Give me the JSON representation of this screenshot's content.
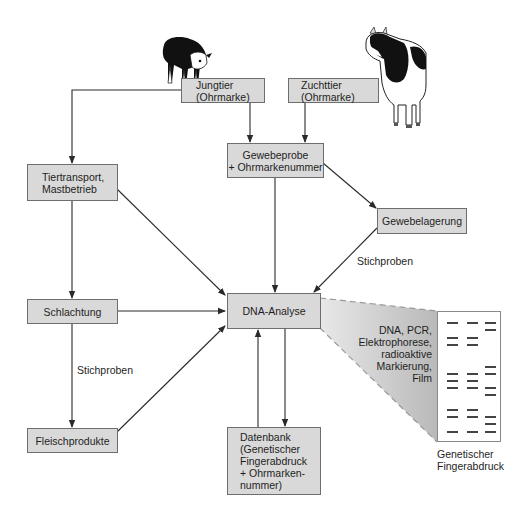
{
  "diagram": {
    "nodes": {
      "jungtier": "Jungtier\n(Ohrmarke)",
      "zuchttier": "Zuchttier\n(Ohrmarke)",
      "gewebeprobe": "Gewebeprobe\n+ Ohrmarkenummer",
      "tiertransport": "Tiertransport,\nMastbetrieb",
      "gewebelagerung": "Gewebelagerung",
      "schlachtung": "Schlachtung",
      "dna_analyse": "DNA-Analyse",
      "fleischprodukte": "Fleischprodukte",
      "datenbank": "Datenbank\n(Genetischer\nFingerabdruck\n+ Ohrmarken-\nnummer)"
    },
    "edge_labels": {
      "stichproben_gewebelagerung": "Stichproben",
      "stichproben_schlachtung": "Stichproben"
    },
    "method_text": "DNA, PCR,\nElektrophorese,\nradioaktive\nMarkierung,\nFilm",
    "gel_caption": "Genetischer\nFingerabdruck",
    "gel_lanes": [
      [
        0,
        15,
        22,
        51,
        58,
        65,
        87,
        94,
        109
      ],
      [
        0,
        15,
        22,
        51,
        58,
        65,
        87,
        94,
        109
      ],
      [
        0,
        7,
        44,
        51,
        65,
        72,
        94,
        101,
        109
      ]
    ],
    "edges": [
      {
        "from": "jungtier",
        "to": "tiertransport"
      },
      {
        "from": "jungtier",
        "to": "gewebeprobe"
      },
      {
        "from": "zuchttier",
        "to": "gewebeprobe"
      },
      {
        "from": "gewebeprobe",
        "to": "gewebelagerung"
      },
      {
        "from": "gewebeprobe",
        "to": "dna_analyse"
      },
      {
        "from": "gewebelagerung",
        "to": "dna_analyse",
        "label": "Stichproben"
      },
      {
        "from": "tiertransport",
        "to": "schlachtung"
      },
      {
        "from": "tiertransport",
        "to": "dna_analyse"
      },
      {
        "from": "schlachtung",
        "to": "dna_analyse"
      },
      {
        "from": "schlachtung",
        "to": "fleischprodukte",
        "label": "Stichproben"
      },
      {
        "from": "fleischprodukte",
        "to": "dna_analyse"
      },
      {
        "from": "dna_analyse",
        "to": "datenbank"
      },
      {
        "from": "datenbank",
        "to": "dna_analyse"
      }
    ],
    "illustrations": [
      "calf-illustration",
      "cow-illustration"
    ],
    "colors": {
      "box_fill": "#d9d9d9",
      "box_border": "#6e6e6e",
      "line": "#2a2a2a",
      "projection_fill": "#c8c8c8"
    }
  }
}
